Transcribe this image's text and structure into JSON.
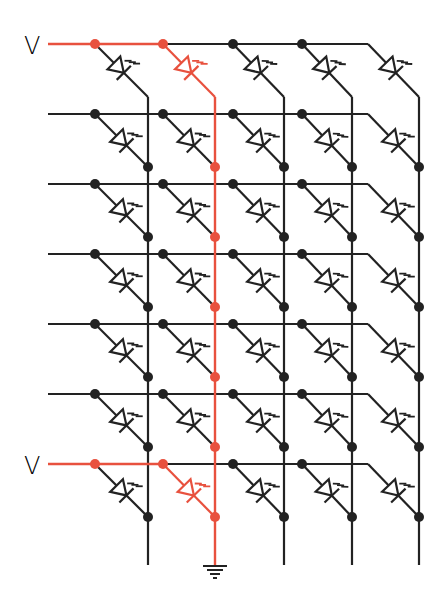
{
  "diagram": {
    "labels": [
      {
        "text": "V",
        "row": 0
      },
      {
        "text": "V",
        "row": 6
      }
    ],
    "colors": {
      "wire": "#222222",
      "active": "#e8513e",
      "background": "#ffffff"
    },
    "grid": {
      "rows": 7,
      "cols": 5,
      "row_y": [
        44,
        114,
        184,
        254,
        324,
        394,
        464
      ],
      "anode_x": [
        95,
        163,
        233,
        302,
        368
      ],
      "column_x": [
        148,
        215,
        284,
        352,
        419
      ],
      "row_line_start_x": 48,
      "row_line_end_x": 368,
      "drop": 53,
      "top_bend_y": 97,
      "column_bottom_y": 565
    },
    "active_path": {
      "column": 1,
      "rows_driven": [
        0,
        6
      ],
      "active_leds": [
        {
          "row": 0,
          "col": 1
        },
        {
          "row": 6,
          "col": 1
        }
      ],
      "ground_symbol": "ground-icon"
    },
    "led_symbol": "led-icon"
  }
}
